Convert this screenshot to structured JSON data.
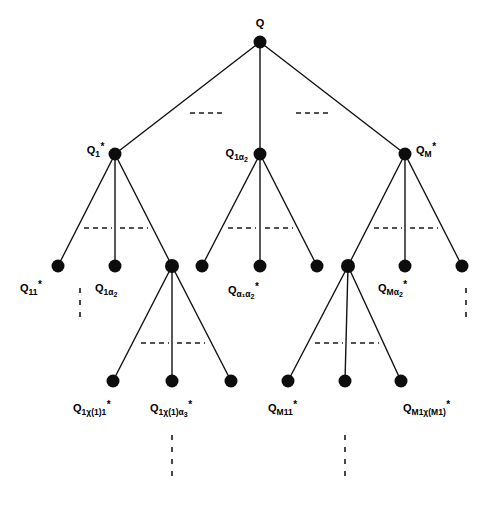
{
  "figure": {
    "type": "tree-diagram",
    "background_color": "#ffffff",
    "ink_color": "#0d0d0d",
    "width": 488,
    "height": 505
  },
  "labels": {
    "root": {
      "base": "Q",
      "sub": "",
      "sub2": "",
      "star": ""
    },
    "level2_left": {
      "base": "Q",
      "sub": "1",
      "sub2": "",
      "star": "*"
    },
    "level2_mid": {
      "base": "Q",
      "sub": "1α",
      "sub2": "2",
      "star": ""
    },
    "level2_right": {
      "base": "Q",
      "sub": "M",
      "sub2": "",
      "star": "*"
    },
    "level3_a": {
      "base": "Q",
      "sub": "11",
      "sub2": "",
      "star": "*"
    },
    "level3_b": {
      "base": "Q",
      "sub": "1α",
      "sub2": "2",
      "star": ""
    },
    "level3_c": {
      "base": "Q",
      "sub": "α₁α",
      "sub2": "2",
      "star": "*"
    },
    "level3_d": {
      "base": "Q",
      "sub": "Mα",
      "sub2": "2",
      "star": "*"
    },
    "level4_a": {
      "base": "Q",
      "sub": "1χ(1)1",
      "sub2": "",
      "star": "*"
    },
    "level4_b": {
      "base": "Q",
      "sub": "1χ(1)α",
      "sub2": "3",
      "star": "*"
    },
    "level4_c": {
      "base": "Q",
      "sub": "M11",
      "sub2": "",
      "star": "*"
    },
    "level4_d": {
      "base": "Q",
      "sub": "M1χ(M1)",
      "sub2": "",
      "star": "*"
    }
  },
  "nodes": [
    {
      "id": "root",
      "x": 260,
      "y": 42,
      "r": 6.5,
      "level": 1
    },
    {
      "id": "n2a",
      "x": 115,
      "y": 154,
      "r": 6.5,
      "level": 2
    },
    {
      "id": "n2b",
      "x": 260,
      "y": 154,
      "r": 6.5,
      "level": 2
    },
    {
      "id": "n2c",
      "x": 405,
      "y": 154,
      "r": 6.5,
      "level": 2
    },
    {
      "id": "n3a",
      "x": 58,
      "y": 266,
      "r": 6.5,
      "level": 3
    },
    {
      "id": "n3b",
      "x": 115,
      "y": 266,
      "r": 6.5,
      "level": 3
    },
    {
      "id": "n3c",
      "x": 172,
      "y": 266,
      "r": 7.0,
      "level": 3
    },
    {
      "id": "n3d",
      "x": 202,
      "y": 266,
      "r": 6.5,
      "level": 3
    },
    {
      "id": "n3e",
      "x": 260,
      "y": 266,
      "r": 6.5,
      "level": 3
    },
    {
      "id": "n3f",
      "x": 317,
      "y": 266,
      "r": 6.5,
      "level": 3
    },
    {
      "id": "n3g",
      "x": 348,
      "y": 266,
      "r": 7.0,
      "level": 3
    },
    {
      "id": "n3h",
      "x": 405,
      "y": 266,
      "r": 6.5,
      "level": 3
    },
    {
      "id": "n3i",
      "x": 462,
      "y": 266,
      "r": 6.5,
      "level": 3
    },
    {
      "id": "n4a",
      "x": 113,
      "y": 381,
      "r": 6.5,
      "level": 4
    },
    {
      "id": "n4b",
      "x": 172,
      "y": 381,
      "r": 6.5,
      "level": 4
    },
    {
      "id": "n4c",
      "x": 231,
      "y": 381,
      "r": 6.5,
      "level": 4
    },
    {
      "id": "n4d",
      "x": 288,
      "y": 381,
      "r": 6.5,
      "level": 4
    },
    {
      "id": "n4e",
      "x": 345,
      "y": 381,
      "r": 6.5,
      "level": 4
    },
    {
      "id": "n4f",
      "x": 401,
      "y": 381,
      "r": 6.5,
      "level": 4
    }
  ],
  "edges": [
    {
      "from": "root",
      "to": "n2a"
    },
    {
      "from": "root",
      "to": "n2b"
    },
    {
      "from": "root",
      "to": "n2c"
    },
    {
      "from": "n2a",
      "to": "n3a"
    },
    {
      "from": "n2a",
      "to": "n3b"
    },
    {
      "from": "n2a",
      "to": "n3c"
    },
    {
      "from": "n2b",
      "to": "n3d"
    },
    {
      "from": "n2b",
      "to": "n3e"
    },
    {
      "from": "n2b",
      "to": "n3f"
    },
    {
      "from": "n2c",
      "to": "n3g"
    },
    {
      "from": "n2c",
      "to": "n3h"
    },
    {
      "from": "n2c",
      "to": "n3i"
    },
    {
      "from": "n3c",
      "to": "n4a"
    },
    {
      "from": "n3c",
      "to": "n4b"
    },
    {
      "from": "n3c",
      "to": "n4c"
    },
    {
      "from": "n3g",
      "to": "n4d"
    },
    {
      "from": "n3g",
      "to": "n4e"
    },
    {
      "from": "n3g",
      "to": "n4f"
    }
  ],
  "ellipsis_horizontal": [
    {
      "id": "eh1",
      "x1": 190,
      "x2": 222,
      "y": 113
    },
    {
      "id": "eh2",
      "x1": 296,
      "x2": 328,
      "y": 113
    },
    {
      "id": "eh3",
      "x1": 84,
      "x2": 112,
      "y": 228
    },
    {
      "id": "eh4",
      "x1": 120,
      "x2": 148,
      "y": 228
    },
    {
      "id": "eh5",
      "x1": 228,
      "x2": 256,
      "y": 228
    },
    {
      "id": "eh6",
      "x1": 265,
      "x2": 293,
      "y": 228
    },
    {
      "id": "eh7",
      "x1": 374,
      "x2": 402,
      "y": 228
    },
    {
      "id": "eh8",
      "x1": 410,
      "x2": 438,
      "y": 228
    },
    {
      "id": "eh9",
      "x1": 141,
      "x2": 169,
      "y": 343
    },
    {
      "id": "eh10",
      "x1": 177,
      "x2": 205,
      "y": 343
    },
    {
      "id": "eh11",
      "x1": 315,
      "x2": 343,
      "y": 343
    },
    {
      "id": "eh12",
      "x1": 351,
      "x2": 379,
      "y": 343
    }
  ],
  "ellipsis_vertical": [
    {
      "id": "ev1",
      "x": 80,
      "y1": 288,
      "y2": 320
    },
    {
      "id": "ev2",
      "x": 466,
      "y1": 288,
      "y2": 320
    },
    {
      "id": "ev3",
      "x": 172,
      "y1": 435,
      "y2": 482
    },
    {
      "id": "ev4",
      "x": 345,
      "y1": 435,
      "y2": 482
    }
  ],
  "label_positions": [
    {
      "id": "root",
      "key": "root",
      "x": 260,
      "y": 18,
      "anchor": "center"
    },
    {
      "id": "level2_left",
      "key": "level2_left",
      "x": 104,
      "y": 150,
      "anchor": "left"
    },
    {
      "id": "level2_mid",
      "key": "level2_mid",
      "x": 248,
      "y": 153,
      "anchor": "left"
    },
    {
      "id": "level2_right",
      "key": "level2_right",
      "x": 416,
      "y": 150,
      "anchor": "right"
    },
    {
      "id": "level3_a",
      "key": "level3_a",
      "x": 20,
      "y": 288,
      "anchor": "right"
    },
    {
      "id": "level3_b",
      "key": "level3_b",
      "x": 95,
      "y": 288,
      "anchor": "right"
    },
    {
      "id": "level3_c",
      "key": "level3_c",
      "x": 228,
      "y": 290,
      "anchor": "right"
    },
    {
      "id": "level3_d",
      "key": "level3_d",
      "x": 378,
      "y": 288,
      "anchor": "right"
    },
    {
      "id": "level4_a",
      "key": "level4_a",
      "x": 73,
      "y": 408,
      "anchor": "right"
    },
    {
      "id": "level4_b",
      "key": "level4_b",
      "x": 150,
      "y": 408,
      "anchor": "right"
    },
    {
      "id": "level4_c",
      "key": "level4_c",
      "x": 268,
      "y": 408,
      "anchor": "right"
    },
    {
      "id": "level4_d",
      "key": "level4_d",
      "x": 403,
      "y": 408,
      "anchor": "right"
    }
  ]
}
